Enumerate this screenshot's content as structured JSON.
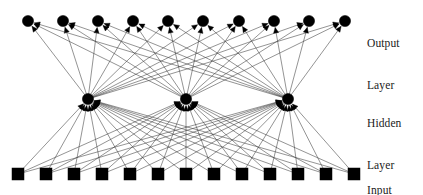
{
  "figure": {
    "kind": "neural-network-diagram",
    "title": "",
    "background_color": "#ffffff",
    "ink_color": "#000000",
    "edge_color": "#3a3a3a",
    "width": 423,
    "height": 195
  },
  "labels": {
    "output": {
      "line1": "Output",
      "line2": "Layer"
    },
    "hidden": {
      "line1": "Hidden",
      "line2": "Layer"
    },
    "input": {
      "line1": "Input",
      "line2": "Layer"
    }
  },
  "chart_data": {
    "type": "diagram",
    "title": "",
    "layers": [
      {
        "name": "Output Layer",
        "role": "output",
        "node_count": 10,
        "node_shape": "circle",
        "node_radius": 5.6,
        "y": 21,
        "x_positions": [
          28,
          63,
          98,
          133,
          168,
          203,
          239,
          274,
          309,
          345
        ]
      },
      {
        "name": "Hidden Layer",
        "role": "hidden",
        "node_count": 3,
        "node_shape": "circle",
        "node_radius": 5.6,
        "y": 99,
        "x_positions": [
          88,
          186,
          288
        ]
      },
      {
        "name": "Input Layer",
        "role": "input",
        "node_count": 13,
        "node_shape": "square",
        "node_size": 12,
        "y": 174,
        "x_positions": [
          18,
          46,
          74,
          102,
          130,
          158,
          186,
          214,
          242,
          270,
          298,
          326,
          354
        ]
      }
    ],
    "connections": [
      {
        "from": "input",
        "to": "hidden",
        "kind": "fully-connected",
        "directed": true,
        "edge_count": 39
      },
      {
        "from": "hidden",
        "to": "output",
        "kind": "fully-connected",
        "directed": true,
        "edge_count": 30
      }
    ],
    "arrow_direction": "upward",
    "legend": [],
    "grid": false
  }
}
